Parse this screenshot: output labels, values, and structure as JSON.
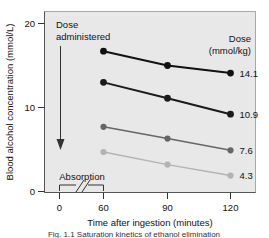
{
  "figure": {
    "caption": "Fig. 1.1   Saturation kinetics of ethanol elimination",
    "plot_background": "#e8e8e8",
    "frame_color": "#9a9a9a"
  },
  "chart_data": {
    "type": "line",
    "title": "",
    "xlabel": "Time after ingestion (minutes)",
    "ylabel": "Blood alcohol concentration (mmol/L)",
    "x": [
      60,
      90,
      120
    ],
    "xticks": [
      0,
      60,
      90,
      120
    ],
    "xtick_labels": [
      "0",
      "60",
      "90",
      "120"
    ],
    "yticks": [
      0,
      10,
      20
    ],
    "ytick_labels": [
      "0",
      "10",
      "20"
    ],
    "xlim": [
      0,
      135
    ],
    "ylim": [
      0,
      22
    ],
    "grid": false,
    "legend_position": "right",
    "legend_title": "Dose",
    "legend_units": "(mmol/kg)",
    "axis_break": true,
    "series": [
      {
        "name": "14.1",
        "label": "14.1",
        "color": "#111111",
        "values": [
          16.7,
          15.0,
          14.1
        ]
      },
      {
        "name": "10.9",
        "label": "10.9",
        "color": "#1a1a1a",
        "values": [
          13.0,
          11.1,
          9.2
        ]
      },
      {
        "name": "7.6",
        "label": "7.6",
        "color": "#666666",
        "values": [
          7.7,
          6.3,
          4.9
        ]
      },
      {
        "name": "4.3",
        "label": "4.3",
        "color": "#b3b3b3",
        "values": [
          4.7,
          3.2,
          1.9
        ]
      }
    ],
    "annotations": [
      {
        "name": "dose-administered",
        "text_line1": "Dose",
        "text_line2": "administered",
        "type": "arrow-down"
      },
      {
        "name": "absorption",
        "text": "Absorption",
        "type": "bracket"
      }
    ]
  },
  "legend": {
    "title": "Dose",
    "units": "(mmol/kg)",
    "entries": [
      "14.1",
      "10.9",
      "7.6",
      "4.3"
    ]
  },
  "axes": {
    "y_title": "Blood alcohol concentration (mmol/L)",
    "x_title": "Time after ingestion (minutes)",
    "y_ticks": [
      "20",
      "10",
      "0"
    ],
    "x_ticks": [
      "0",
      "60",
      "90",
      "120"
    ]
  },
  "annotations": {
    "dose_line1": "Dose",
    "dose_line2": "administered",
    "absorption": "Absorption"
  }
}
